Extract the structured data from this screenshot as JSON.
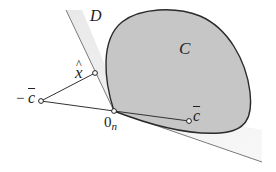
{
  "figure": {
    "labels": {
      "D": "D",
      "C": "C",
      "x_hat": "x",
      "x_hat_accent": "^",
      "neg_c_bar_sign": "−",
      "neg_c_bar": "c",
      "origin": "0",
      "origin_sub": "n",
      "c_bar": "c"
    },
    "points": {
      "origin": [
        114,
        111
      ],
      "x_hat": [
        95,
        73
      ],
      "neg_c_bar": [
        41,
        101
      ],
      "c_bar": [
        189,
        121
      ]
    },
    "colors": {
      "set_C_fill": "#c8c8c8",
      "set_C_stroke": "#2a2a2a",
      "region_D_fill": "#e8e8e8",
      "line": "#333333"
    }
  }
}
